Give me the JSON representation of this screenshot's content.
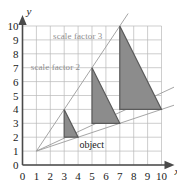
{
  "figure": {
    "kind": "coordinate-grid-enlargement-diagram",
    "background": "#ffffff",
    "grid_color": "#b9b9b9",
    "axis_color": "#4a4a4a",
    "ray_color": "#9b9b9b",
    "shape_fill": "#8c8c8c",
    "shape_stroke": "#5a5a5a",
    "annotation_color": "#8e8e8e",
    "text_color": "#1a1a1a"
  },
  "axes": {
    "x_name": "x",
    "y_name": "y",
    "x_min": 0,
    "x_max": 10,
    "y_min": 0,
    "y_max": 10,
    "x_ticks": [
      "0",
      "1",
      "2",
      "3",
      "4",
      "5",
      "6",
      "7",
      "8",
      "9",
      "10"
    ],
    "y_ticks": [
      "10",
      "9",
      "8",
      "7",
      "6",
      "5",
      "4",
      "3",
      "2",
      "1",
      "0"
    ],
    "grid": true,
    "x_arrow": true,
    "y_arrow": true
  },
  "annotations": [
    {
      "id": "scale-factor-3",
      "text": "scale factor 3",
      "x": 2.2,
      "y": 9.2
    },
    {
      "id": "scale-factor-2",
      "text": "scale factor 2",
      "x": 0.6,
      "y": 7.0
    },
    {
      "id": "object",
      "text": "object",
      "x": 4.1,
      "y": 1.45
    }
  ],
  "chart_data": {
    "type": "scatter",
    "title": "",
    "xlabel": "x",
    "ylabel": "y",
    "xlim": [
      0,
      10
    ],
    "ylim": [
      0,
      10
    ],
    "grid": true,
    "centre_of_enlargement": {
      "x": 1,
      "y": 1
    },
    "shapes": [
      {
        "name": "object",
        "label": "object",
        "scale_factor": 1,
        "points": [
          [
            3,
            4
          ],
          [
            3,
            2
          ],
          [
            4,
            2
          ]
        ],
        "filled": true
      },
      {
        "name": "image-scale-factor-2",
        "label": "scale factor 2",
        "scale_factor": 2,
        "points": [
          [
            5,
            7
          ],
          [
            5,
            3
          ],
          [
            7,
            3
          ]
        ],
        "filled": true
      },
      {
        "name": "image-scale-factor-3",
        "label": "scale factor 3",
        "scale_factor": 3,
        "points": [
          [
            7,
            10
          ],
          [
            7,
            4
          ],
          [
            10,
            4
          ]
        ],
        "filled": true
      }
    ],
    "rays": [
      {
        "name": "ray-to-apex",
        "from": [
          1,
          1
        ],
        "to": [
          7.6,
          10.9
        ]
      },
      {
        "name": "ray-to-right-vertex",
        "from": [
          1,
          1
        ],
        "to": [
          10.9,
          4.3
        ]
      },
      {
        "name": "ray-to-base",
        "from": [
          1,
          1
        ],
        "to": [
          10.9,
          5.6
        ]
      }
    ]
  }
}
